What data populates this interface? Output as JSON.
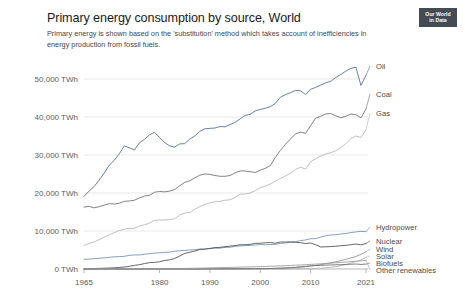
{
  "header": {
    "title": "Primary energy consumption by source, World",
    "subtitle": "Primary energy is shown based on the 'substitution' method which takes account of inefficiencies in energy production from fossil fuels.",
    "logo_line1": "Our World",
    "logo_line2": "in Data"
  },
  "chart_data": {
    "type": "line",
    "title": "Primary energy consumption by source, World",
    "subtitle": "Primary energy is shown based on the 'substitution' method which takes account of inefficiencies in energy production from fossil fuels.",
    "xlabel": "",
    "ylabel": "",
    "unit": "TWh",
    "grid": true,
    "legend_position": "right-inline",
    "xlim": [
      1965,
      2021
    ],
    "ylim": [
      0,
      55000
    ],
    "x_ticks": [
      "1965",
      "1980",
      "1990",
      "2000",
      "2010",
      "2021"
    ],
    "x_tick_values": [
      1965,
      1980,
      1990,
      2000,
      2010,
      2021
    ],
    "y_ticks": [
      "0 TWh",
      "10,000 TWh",
      "20,000 TWh",
      "30,000 TWh",
      "40,000 TWh",
      "50,000 TWh"
    ],
    "y_tick_values": [
      0,
      10000,
      20000,
      30000,
      40000,
      50000
    ],
    "x": [
      1965,
      1966,
      1967,
      1968,
      1969,
      1970,
      1971,
      1972,
      1973,
      1974,
      1975,
      1976,
      1977,
      1978,
      1979,
      1980,
      1981,
      1982,
      1983,
      1984,
      1985,
      1986,
      1987,
      1988,
      1989,
      1990,
      1991,
      1992,
      1993,
      1994,
      1995,
      1996,
      1997,
      1998,
      1999,
      2000,
      2001,
      2002,
      2003,
      2004,
      2005,
      2006,
      2007,
      2008,
      2009,
      2010,
      2011,
      2012,
      2013,
      2014,
      2015,
      2016,
      2017,
      2018,
      2019,
      2020,
      2021
    ],
    "series": [
      {
        "name": "Oil",
        "color": "#4c6a9c",
        "label_color": "#3b3b3b",
        "values": [
          19100,
          20500,
          21700,
          23400,
          25200,
          27300,
          28600,
          30300,
          32400,
          31900,
          31300,
          33200,
          34100,
          35300,
          36000,
          34600,
          33300,
          32400,
          32100,
          32900,
          33000,
          34200,
          35000,
          36200,
          36900,
          37000,
          37100,
          37500,
          37400,
          38000,
          38600,
          39500,
          40400,
          40700,
          41600,
          42000,
          42300,
          42700,
          43600,
          45200,
          45900,
          46400,
          47000,
          46900,
          45900,
          47300,
          47800,
          48400,
          49000,
          49400,
          50400,
          51200,
          52100,
          52800,
          53100,
          48300,
          51000
        ]
      },
      {
        "name": "Coal",
        "color": "#6b6b6b",
        "label_color": "#3b3b3b",
        "values": [
          16300,
          16500,
          16100,
          16400,
          16800,
          17200,
          17100,
          17300,
          17800,
          17900,
          18100,
          18700,
          19200,
          19400,
          20200,
          20400,
          20300,
          20500,
          20900,
          21900,
          22800,
          23200,
          24000,
          24700,
          25000,
          24900,
          24600,
          24400,
          24400,
          24600,
          25300,
          25800,
          25800,
          25600,
          25400,
          26000,
          26500,
          27200,
          29400,
          31200,
          32800,
          34200,
          35600,
          36000,
          35700,
          37700,
          39700,
          40200,
          40800,
          40900,
          40300,
          39800,
          40200,
          40800,
          40600,
          39800,
          42100
        ]
      },
      {
        "name": "Gas",
        "color": "#b5b5b5",
        "label_color": "#8a8a8a",
        "values": [
          6200,
          6700,
          7100,
          7700,
          8400,
          9000,
          9600,
          10100,
          10500,
          10700,
          10700,
          11300,
          11600,
          12100,
          12800,
          12900,
          12900,
          13000,
          13200,
          14200,
          14700,
          14900,
          15700,
          16400,
          17000,
          17400,
          17700,
          17800,
          18100,
          18200,
          18800,
          19700,
          19700,
          20000,
          20600,
          21400,
          21800,
          22400,
          23100,
          23800,
          24500,
          25200,
          26200,
          26800,
          26300,
          28200,
          29000,
          29700,
          30300,
          30600,
          31100,
          31900,
          33000,
          34300,
          35000,
          34600,
          36600
        ]
      },
      {
        "name": "Hydropower",
        "color": "#6e8fb5",
        "label_color": "#6a6a6a",
        "values": [
          2530,
          2620,
          2700,
          2830,
          2920,
          3090,
          3180,
          3270,
          3330,
          3600,
          3700,
          3690,
          3880,
          4050,
          4180,
          4280,
          4380,
          4440,
          4660,
          4810,
          4880,
          5010,
          5080,
          5260,
          5230,
          5410,
          5490,
          5470,
          5680,
          5730,
          5960,
          6080,
          6130,
          6220,
          6300,
          6440,
          6370,
          6450,
          6490,
          6720,
          6850,
          7050,
          7190,
          7460,
          7640,
          7980,
          7990,
          8400,
          8740,
          8980,
          9000,
          9230,
          9340,
          9580,
          9760,
          9890,
          9830
        ]
      },
      {
        "name": "Nuclear",
        "color": "#4a4a4a",
        "label_color": "#2f2f2f",
        "values": [
          70,
          90,
          120,
          160,
          210,
          250,
          320,
          400,
          520,
          700,
          950,
          1130,
          1420,
          1670,
          1750,
          1900,
          2240,
          2400,
          2760,
          3400,
          4100,
          4400,
          4730,
          5150,
          5230,
          5400,
          5630,
          5690,
          5880,
          6020,
          6180,
          6380,
          6390,
          6480,
          6750,
          6780,
          6900,
          6940,
          6790,
          7090,
          7100,
          7120,
          7020,
          6930,
          6700,
          6840,
          6400,
          5800,
          5840,
          5910,
          5990,
          6130,
          6210,
          6410,
          6580,
          6350,
          6700
        ]
      },
      {
        "name": "Wind",
        "color": "#8d8d8d",
        "label_color": "#6a6a6a",
        "values": [
          0,
          0,
          0,
          0,
          0,
          0,
          0,
          0,
          0,
          0,
          0,
          0,
          0,
          0,
          0,
          0,
          0,
          0,
          0,
          0,
          1,
          2,
          3,
          4,
          6,
          9,
          12,
          16,
          20,
          25,
          33,
          40,
          49,
          60,
          75,
          90,
          105,
          130,
          160,
          200,
          250,
          310,
          390,
          490,
          610,
          760,
          950,
          1160,
          1390,
          1620,
          1890,
          2200,
          2530,
          2900,
          3280,
          3870,
          4570
        ]
      },
      {
        "name": "Solar",
        "color": "#b0b0b0",
        "label_color": "#8a8a8a",
        "values": [
          0,
          0,
          0,
          0,
          0,
          0,
          0,
          0,
          0,
          0,
          0,
          0,
          0,
          0,
          0,
          0,
          0,
          0,
          0,
          0,
          0,
          0,
          0,
          0,
          0,
          0,
          1,
          1,
          1,
          2,
          2,
          2,
          3,
          3,
          4,
          5,
          6,
          7,
          9,
          12,
          16,
          22,
          30,
          42,
          58,
          85,
          140,
          220,
          330,
          470,
          640,
          860,
          1180,
          1560,
          1980,
          2390,
          3060
        ]
      },
      {
        "name": "Biofuels",
        "color": "#6b6b6b",
        "label_color": "#2f2f2f",
        "values": [
          0,
          0,
          0,
          0,
          0,
          0,
          0,
          0,
          0,
          0,
          0,
          0,
          0,
          0,
          0,
          0,
          0,
          0,
          0,
          0,
          0,
          0,
          0,
          0,
          0,
          20,
          25,
          30,
          35,
          42,
          50,
          58,
          66,
          75,
          85,
          100,
          115,
          135,
          165,
          205,
          260,
          340,
          440,
          580,
          690,
          820,
          900,
          960,
          1010,
          1070,
          1100,
          1130,
          1200,
          1260,
          1310,
          1210,
          1290
        ]
      },
      {
        "name": "Other renewables",
        "color": "#9a9a9a",
        "label_color": "#4a4a4a",
        "values": [
          0,
          0,
          0,
          0,
          0,
          0,
          0,
          0,
          0,
          5,
          10,
          15,
          22,
          30,
          40,
          52,
          66,
          82,
          100,
          120,
          145,
          170,
          200,
          230,
          265,
          300,
          330,
          360,
          390,
          420,
          455,
          490,
          525,
          560,
          595,
          640,
          680,
          720,
          765,
          815,
          870,
          930,
          1000,
          1070,
          1130,
          1210,
          1290,
          1370,
          1460,
          1550,
          1640,
          1730,
          1830,
          1940,
          2050,
          2150,
          2270
        ]
      }
    ],
    "inline_labels": [
      {
        "name": "Oil",
        "y_px": 66
      },
      {
        "name": "Coal",
        "y_px": 94
      },
      {
        "name": "Gas",
        "y_px": 113
      },
      {
        "name": "Hydropower",
        "y_px": 227
      },
      {
        "name": "Nuclear",
        "y_px": 241
      },
      {
        "name": "Wind",
        "y_px": 249
      },
      {
        "name": "Solar",
        "y_px": 256
      },
      {
        "name": "Biofuels",
        "y_px": 263
      },
      {
        "name": "Other renewables",
        "y_px": 270
      }
    ]
  }
}
